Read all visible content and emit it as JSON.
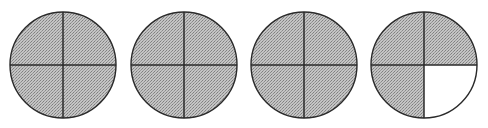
{
  "figure": {
    "shaded_color": "#b8b8b8",
    "pattern_dark": "#8a8a8a",
    "unshaded_color": "#ffffff",
    "stroke_color": "#2a2a2a",
    "radius": 53,
    "circles": [
      {
        "id": 1,
        "cx": 63,
        "cy": 65,
        "parts": 4,
        "shaded_parts": 4,
        "unshaded_quadrant": null
      },
      {
        "id": 2,
        "cx": 184,
        "cy": 65,
        "parts": 4,
        "shaded_parts": 4,
        "unshaded_quadrant": null
      },
      {
        "id": 3,
        "cx": 304,
        "cy": 65,
        "parts": 4,
        "shaded_parts": 4,
        "unshaded_quadrant": null
      },
      {
        "id": 4,
        "cx": 424,
        "cy": 65,
        "parts": 4,
        "shaded_parts": 3,
        "unshaded_quadrant": "bottom-right"
      }
    ],
    "total_shaded_quarters": 15,
    "total_quarters": 16
  }
}
